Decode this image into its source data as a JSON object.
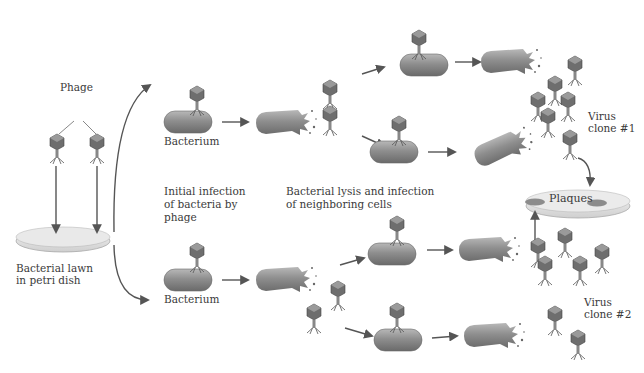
{
  "labels": {
    "phage": "Phage",
    "lawn_line1": "Bacterial lawn",
    "lawn_line2": "in petri dish",
    "bacterium_top": "Bacterium",
    "bacterium_bottom": "Bacterium",
    "initial_line1": "Initial infection",
    "initial_line2": "of bacteria by",
    "initial_line3": "phage",
    "lysis_line1": "Bacterial lysis and infection",
    "lysis_line2": "of neighboring cells",
    "clone1_line1": "Virus",
    "clone1_line2": "clone #1",
    "clone2_line1": "Virus",
    "clone2_line2": "clone #2",
    "plaques": "Plaques"
  },
  "colors": {
    "bacterium": "#8a8a8a",
    "bacterium_dark": "#6a6a6a",
    "bacterium_light": "#b5b5b5",
    "phage_head": "#6e6e6e",
    "arrow": "#555555",
    "dish": "#e6e6e6",
    "plaque": "#8c8c8c",
    "text": "#3a3a3a"
  }
}
